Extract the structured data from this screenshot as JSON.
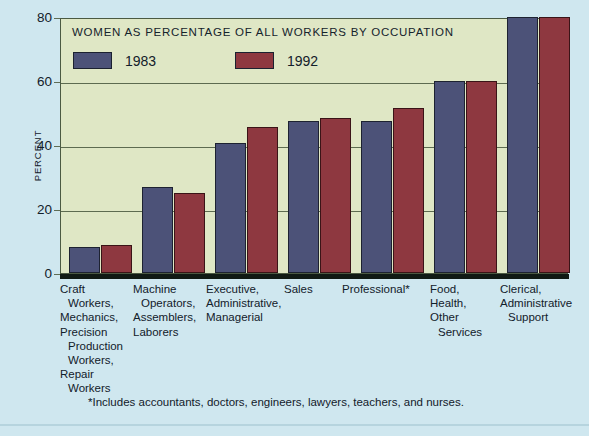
{
  "chart_data": {
    "type": "bar",
    "title": "WOMEN AS PERCENTAGE OF ALL WORKERS BY OCCUPATION",
    "xlabel": "",
    "ylabel": "PERCENT",
    "ylim": [
      0,
      80
    ],
    "yticks": [
      0,
      20,
      40,
      60,
      80
    ],
    "grid": true,
    "legend_position": "top-left",
    "categories": [
      "Craft Workers, Mechanics, Precision Production Workers, Repair Workers",
      "Machine Operators, Assemblers, Laborers",
      "Executive, Administrative, Managerial",
      "Sales",
      "Professional*",
      "Food, Health, Other Services",
      "Clerical, Administrative Support"
    ],
    "series": [
      {
        "name": "1983",
        "color": "#4c5278",
        "values": [
          8.1,
          27.0,
          40.5,
          47.5,
          47.5,
          60.0,
          80.0
        ]
      },
      {
        "name": "1992",
        "color": "#8e3840",
        "values": [
          8.8,
          25.0,
          45.6,
          48.5,
          51.5,
          60.0,
          80.0
        ]
      }
    ],
    "annotations": [
      "*Includes accountants, doctors, engineers, lawyers, teachers, and nurses."
    ]
  },
  "axis": {
    "y_title": "PERCENT",
    "y_ticks": [
      "80",
      "60",
      "40",
      "20",
      "0"
    ]
  },
  "legend": {
    "entries": [
      {
        "label": "1983",
        "color": "#4c5278"
      },
      {
        "label": "1992",
        "color": "#8e3840"
      }
    ]
  },
  "x_labels": [
    {
      "lines": [
        "Craft",
        "Workers,",
        "Mechanics,",
        "Precision",
        "Production",
        "Workers,",
        "Repair",
        "Workers"
      ],
      "indent": [
        false,
        true,
        false,
        false,
        true,
        true,
        false,
        true
      ]
    },
    {
      "lines": [
        "Machine",
        "Operators,",
        "Assemblers,",
        "Laborers"
      ],
      "indent": [
        false,
        true,
        false,
        false
      ]
    },
    {
      "lines": [
        "Executive,",
        "Administrative,",
        "Managerial"
      ],
      "indent": [
        false,
        false,
        false
      ]
    },
    {
      "lines": [
        "Sales"
      ],
      "indent": [
        false
      ]
    },
    {
      "lines": [
        "Professional*"
      ],
      "indent": [
        false
      ]
    },
    {
      "lines": [
        "Food,",
        "Health,",
        "Other",
        "Services"
      ],
      "indent": [
        false,
        false,
        false,
        true
      ]
    },
    {
      "lines": [
        "Clerical,",
        "Administrative",
        "Support"
      ],
      "indent": [
        false,
        false,
        true
      ]
    }
  ],
  "footnote": "*Includes accountants, doctors, engineers, lawyers, teachers, and nurses.",
  "colors": {
    "page_background": "#cfe7ef",
    "plot_background": "#dfe7c5",
    "plot_border": "#4b5a42",
    "gridline": "#5d6b50",
    "baseline": "#101a14",
    "series_1983": "#4c5278",
    "series_1992": "#8e3840",
    "text": "#12202a"
  }
}
